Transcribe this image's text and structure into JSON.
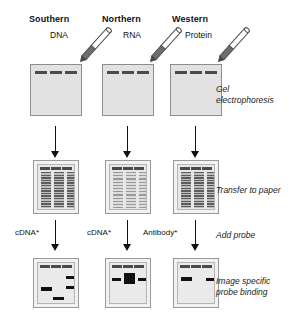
{
  "figure": {
    "columns": [
      {
        "title": "Southern",
        "sample": "DNA",
        "probe": "cDNA*"
      },
      {
        "title": "Northern",
        "sample": "RNA",
        "probe": "cDNA*"
      },
      {
        "title": "Western",
        "sample": "Protein",
        "probe": "Antibody*"
      }
    ],
    "stages": [
      {
        "caption": "Gel\nelectrophoresis"
      },
      {
        "caption": "Transfer to paper"
      },
      {
        "caption": "Add probe"
      },
      {
        "caption": "Image specific\nprobe binding"
      }
    ],
    "colors": {
      "gel_fill": "#e2e2e2",
      "gel_border": "#8d8d8d",
      "blot_fill": "#e7e7e7",
      "well": "#4a4a4a",
      "band": "#111111",
      "smear_dark": "#5d5d5d",
      "smear_light": "#9a9a9a",
      "pipette_tip": "#6e6e6e",
      "background": "#ffffff"
    },
    "well_count": 3,
    "lane_count": 3
  }
}
